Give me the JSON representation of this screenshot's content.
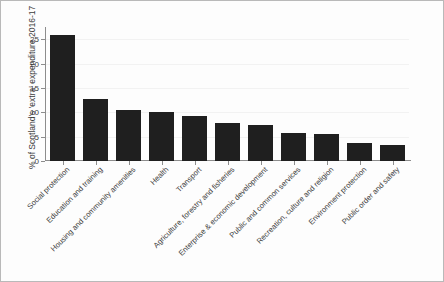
{
  "chart_data": {
    "type": "bar",
    "title": "",
    "xlabel": "",
    "ylabel": "% of Scotland's 'extra' expenditure 2016-17",
    "ylim": [
      0,
      27.5
    ],
    "yticks": [
      0,
      5,
      10,
      15,
      20,
      25
    ],
    "ytick_labels": [
      "0",
      "5",
      "10",
      "15",
      "20",
      "25"
    ],
    "grid": true,
    "legend": "none",
    "bar_color": "#1f1f1f",
    "categories": [
      "Social protection",
      "Education and training",
      "Housing and community amenities",
      "Health",
      "Transport",
      "Agriculture, forestry and fisheries",
      "Enterprise & economic development",
      "Public and common services",
      "Recreation, culture and religion",
      "Environment protection",
      "Public order and safety"
    ],
    "values": [
      25.9,
      12.7,
      10.5,
      10.1,
      9.3,
      7.8,
      7.4,
      5.7,
      5.5,
      3.6,
      3.3
    ]
  }
}
